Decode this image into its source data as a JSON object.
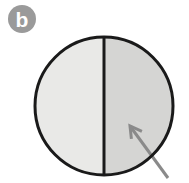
{
  "figure": {
    "panel_label": "b",
    "background_color": "#ffffff",
    "badge": {
      "name": "panel-label-badge",
      "shape": "circle",
      "fill_color": "#9a9a9a",
      "text_color": "#ffffff",
      "center_x": 22,
      "center_y": 19,
      "radius": 14
    },
    "specimen": {
      "name": "circular-specimen",
      "shape": "circle",
      "center_x": 104,
      "center_y": 106,
      "radius": 69,
      "outline_color": "#1a1a1a",
      "outline_width": 3,
      "left_half_fill": "#e9e9e7",
      "right_half_fill": "#d5d5d3"
    },
    "divider": {
      "name": "vertical-divider-line",
      "color": "#1a1a1a",
      "width": 3,
      "x": 104,
      "y_top": 37,
      "y_bottom": 175
    },
    "annotation_arrow": {
      "name": "pointer-arrow",
      "color": "#8a8a8a",
      "stroke_width": 3,
      "tip_x": 130,
      "tip_y": 126,
      "tail_x": 168,
      "tail_y": 178,
      "points_to": "right-half-region",
      "head_length": 13,
      "head_angle_deg": 30
    }
  }
}
